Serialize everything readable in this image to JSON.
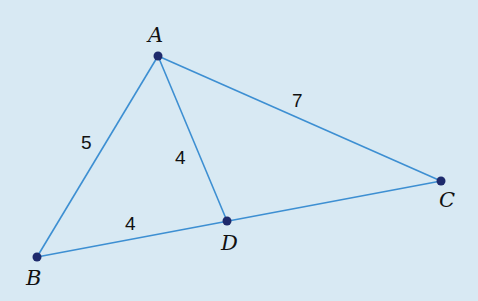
{
  "colors": {
    "background": "#d8e9f3",
    "line": "#3d8fd2",
    "point": "#1e2a6c",
    "text": "#111111"
  },
  "points": {
    "A": {
      "label": "A",
      "x": 158,
      "y": 56
    },
    "B": {
      "label": "B",
      "x": 37,
      "y": 257
    },
    "C": {
      "label": "C",
      "x": 441,
      "y": 181
    },
    "D": {
      "label": "D",
      "x": 227,
      "y": 221
    }
  },
  "segments": [
    {
      "from": "A",
      "to": "B",
      "length_label": "5"
    },
    {
      "from": "A",
      "to": "C",
      "length_label": "7"
    },
    {
      "from": "A",
      "to": "D",
      "length_label": "4"
    },
    {
      "from": "B",
      "to": "D",
      "length_label": "4"
    },
    {
      "from": "D",
      "to": "C",
      "length_label": ""
    }
  ],
  "labels": {
    "AB": "5",
    "AC": "7",
    "AD": "4",
    "BD": "4"
  }
}
